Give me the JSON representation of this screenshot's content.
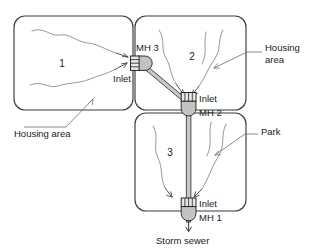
{
  "diagram": {
    "colors": {
      "box_stroke": "#3b3b3b",
      "stream_stroke": "#8c8c8c",
      "manhole_fill": "#c2c2c2",
      "pipe_fill": "#c9c9c9",
      "grate_fill": "#e8e8e8",
      "text": "#1a1a1a"
    }
  },
  "catchments": [
    {
      "id": "area-1",
      "label": "1",
      "annotation": "Housing area"
    },
    {
      "id": "area-2",
      "label": "2",
      "annotation_line1": "Housing",
      "annotation_line2": "area"
    },
    {
      "id": "area-3",
      "label": "3",
      "annotation": "Park"
    }
  ],
  "manholes": [
    {
      "id": "mh-3",
      "label": "MH 3",
      "inlet_label": "Inlet"
    },
    {
      "id": "mh-2",
      "label": "MH 2",
      "inlet_label": "Inlet"
    },
    {
      "id": "mh-1",
      "label": "MH 1",
      "inlet_label": "Inlet"
    }
  ],
  "outfall": {
    "label": "Storm sewer"
  }
}
